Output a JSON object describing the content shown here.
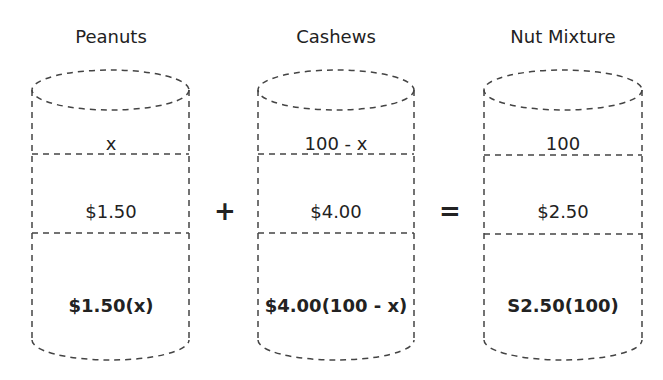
{
  "containers": [
    {
      "title": "Peanuts",
      "amount": "x",
      "price": "$1.50",
      "value": "$1.50(x)"
    },
    {
      "title": "Cashews",
      "amount": "100 - x",
      "price": "$4.00",
      "value": "$4.00(100 - x)"
    },
    {
      "title": "Nut Mixture",
      "amount": "100",
      "price": "$2.50",
      "value": "S2.50(100)"
    }
  ],
  "operators": {
    "plus": "+",
    "equals": "="
  },
  "colors": {
    "stroke": "#444444",
    "text": "#222222",
    "background": "#ffffff"
  }
}
